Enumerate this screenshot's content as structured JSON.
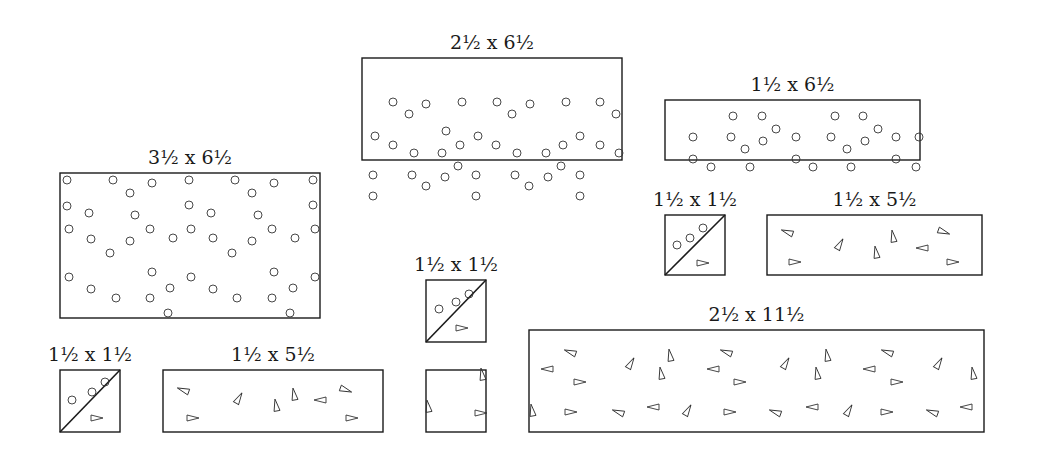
{
  "diagram": {
    "pieces": [
      {
        "id": "p1",
        "label": "2½ x 6½",
        "x": 362,
        "y": 58,
        "w": 260,
        "h": 102,
        "pattern": "circles",
        "diagonal": false,
        "marks": [
          [
            31,
            44
          ],
          [
            64,
            46
          ],
          [
            100,
            44
          ],
          [
            135,
            44
          ],
          [
            168,
            46
          ],
          [
            204,
            44
          ],
          [
            238,
            44
          ],
          [
            47,
            56
          ],
          [
            150,
            56
          ],
          [
            254,
            56
          ],
          [
            13,
            78
          ],
          [
            84,
            73
          ],
          [
            116,
            78
          ],
          [
            31,
            87
          ],
          [
            52,
            95
          ],
          [
            80,
            95
          ],
          [
            98,
            87
          ],
          [
            134,
            87
          ],
          [
            155,
            95
          ],
          [
            184,
            95
          ],
          [
            218,
            78
          ],
          [
            201,
            87
          ],
          [
            238,
            87
          ],
          [
            257,
            95
          ],
          [
            11,
            117
          ],
          [
            50,
            117
          ],
          [
            96,
            108
          ],
          [
            83,
            119
          ],
          [
            114,
            117
          ],
          [
            153,
            117
          ],
          [
            186,
            119
          ],
          [
            199,
            108
          ],
          [
            218,
            117
          ],
          [
            64,
            128
          ],
          [
            167,
            128
          ],
          [
            11,
            138
          ],
          [
            114,
            138
          ],
          [
            218,
            138
          ]
        ]
      },
      {
        "id": "p2",
        "label": "1½ x 6½",
        "x": 665,
        "y": 100,
        "w": 255,
        "h": 60,
        "pattern": "circles",
        "diagonal": false,
        "marks": [
          [
            68,
            16
          ],
          [
            97,
            16
          ],
          [
            170,
            16
          ],
          [
            198,
            16
          ],
          [
            111,
            29
          ],
          [
            213,
            29
          ],
          [
            28,
            37
          ],
          [
            66,
            37
          ],
          [
            98,
            41
          ],
          [
            131,
            37
          ],
          [
            166,
            37
          ],
          [
            200,
            41
          ],
          [
            231,
            37
          ],
          [
            254,
            37
          ],
          [
            80,
            49
          ],
          [
            182,
            49
          ],
          [
            28,
            59
          ],
          [
            46,
            67
          ],
          [
            85,
            67
          ],
          [
            131,
            59
          ],
          [
            148,
            67
          ],
          [
            186,
            67
          ],
          [
            231,
            59
          ],
          [
            251,
            67
          ]
        ]
      },
      {
        "id": "p3",
        "label": "3½ x 6½",
        "x": 60,
        "y": 173,
        "w": 260,
        "h": 145,
        "pattern": "circles",
        "diagonal": false,
        "marks": [
          [
            7,
            7
          ],
          [
            53,
            7
          ],
          [
            92,
            10
          ],
          [
            129,
            7
          ],
          [
            175,
            7
          ],
          [
            214,
            10
          ],
          [
            253,
            7
          ],
          [
            70,
            20
          ],
          [
            192,
            20
          ],
          [
            7,
            33
          ],
          [
            129,
            32
          ],
          [
            253,
            32
          ],
          [
            29,
            40
          ],
          [
            75,
            42
          ],
          [
            151,
            40
          ],
          [
            198,
            42
          ],
          [
            9,
            56
          ],
          [
            90,
            56
          ],
          [
            131,
            56
          ],
          [
            212,
            56
          ],
          [
            255,
            56
          ],
          [
            31,
            66
          ],
          [
            70,
            68
          ],
          [
            113,
            65
          ],
          [
            153,
            65
          ],
          [
            192,
            68
          ],
          [
            235,
            65
          ],
          [
            50,
            80
          ],
          [
            172,
            80
          ],
          [
            9,
            104
          ],
          [
            92,
            99
          ],
          [
            131,
            104
          ],
          [
            214,
            99
          ],
          [
            255,
            104
          ],
          [
            31,
            116
          ],
          [
            110,
            115
          ],
          [
            153,
            116
          ],
          [
            233,
            115
          ],
          [
            56,
            125
          ],
          [
            90,
            125
          ],
          [
            177,
            125
          ],
          [
            212,
            125
          ],
          [
            108,
            140
          ],
          [
            230,
            140
          ]
        ]
      },
      {
        "id": "p4",
        "label": "1½ x 1½",
        "x": 665,
        "y": 215,
        "w": 60,
        "h": 60,
        "pattern": "circles",
        "diagonal": true,
        "marks": [
          [
            12,
            30
          ],
          [
            25,
            23
          ],
          [
            38,
            13
          ]
        ],
        "tri_marks": [
          [
            38,
            48,
            0
          ]
        ]
      },
      {
        "id": "p5",
        "label": "1½ x 5½",
        "x": 767,
        "y": 215,
        "w": 215,
        "h": 60,
        "pattern": "triangles",
        "diagonal": false,
        "tri_marks": [
          [
            20,
            17,
            200
          ],
          [
            73,
            29,
            -60
          ],
          [
            126,
            21,
            -100
          ],
          [
            109,
            37,
            -100
          ],
          [
            177,
            17,
            20
          ],
          [
            155,
            33,
            180
          ],
          [
            28,
            47,
            0
          ],
          [
            186,
            47,
            0
          ]
        ]
      },
      {
        "id": "p6",
        "label": "1½ x 1½",
        "x": 426,
        "y": 280,
        "w": 60,
        "h": 62,
        "pattern": "circles",
        "diagonal": true,
        "marks": [
          [
            13,
            29
          ],
          [
            30,
            22
          ],
          [
            43,
            14
          ]
        ],
        "tri_marks": [
          [
            36,
            48,
            0
          ]
        ]
      },
      {
        "id": "p7",
        "label": "1½ x 1½",
        "x": 60,
        "y": 370,
        "w": 60,
        "h": 62,
        "pattern": "circles",
        "diagonal": true,
        "marks": [
          [
            12,
            30
          ],
          [
            32,
            22
          ],
          [
            45,
            12
          ]
        ],
        "tri_marks": [
          [
            37,
            48,
            0
          ]
        ]
      },
      {
        "id": "p8",
        "label": "1½ x 5½",
        "x": 163,
        "y": 370,
        "w": 220,
        "h": 62,
        "pattern": "triangles",
        "diagonal": false,
        "tri_marks": [
          [
            20,
            20,
            200
          ],
          [
            76,
            28,
            -60
          ],
          [
            131,
            24,
            -100
          ],
          [
            113,
            35,
            -100
          ],
          [
            183,
            20,
            20
          ],
          [
            157,
            30,
            180
          ],
          [
            30,
            48,
            0
          ],
          [
            189,
            48,
            0
          ]
        ]
      },
      {
        "id": "p9",
        "label": "",
        "x": 426,
        "y": 370,
        "w": 60,
        "h": 62,
        "pattern": "triangles",
        "diagonal": false,
        "tri_marks": [
          [
            56,
            4,
            -100
          ],
          [
            2,
            36,
            -100
          ],
          [
            55,
            43,
            0
          ]
        ]
      },
      {
        "id": "p10",
        "label": "2½ x 11½",
        "x": 529,
        "y": 330,
        "w": 455,
        "h": 102,
        "pattern": "triangles",
        "diagonal": false,
        "tri_marks": [
          [
            41,
            22,
            200
          ],
          [
            18,
            39,
            180
          ],
          [
            51,
            52,
            0
          ],
          [
            102,
            33,
            -60
          ],
          [
            141,
            25,
            -100
          ],
          [
            132,
            43,
            -100
          ],
          [
            184,
            39,
            180
          ],
          [
            197,
            22,
            200
          ],
          [
            211,
            52,
            0
          ],
          [
            257,
            33,
            -60
          ],
          [
            298,
            25,
            -100
          ],
          [
            288,
            43,
            -100
          ],
          [
            340,
            39,
            180
          ],
          [
            358,
            22,
            200
          ],
          [
            368,
            52,
            0
          ],
          [
            410,
            33,
            -60
          ],
          [
            444,
            43,
            -100
          ],
          [
            3,
            80,
            -100
          ],
          [
            42,
            82,
            0
          ],
          [
            89,
            82,
            200
          ],
          [
            124,
            77,
            180
          ],
          [
            159,
            80,
            -60
          ],
          [
            201,
            82,
            0
          ],
          [
            246,
            82,
            200
          ],
          [
            283,
            77,
            180
          ],
          [
            320,
            80,
            -60
          ],
          [
            358,
            82,
            0
          ],
          [
            403,
            82,
            200
          ],
          [
            437,
            77,
            180
          ]
        ]
      }
    ]
  }
}
